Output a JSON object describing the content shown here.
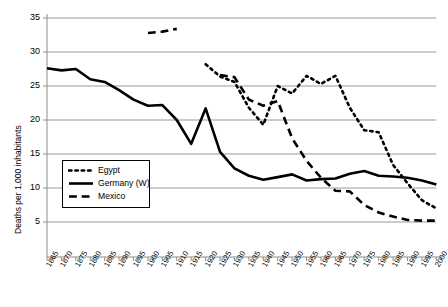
{
  "chart_data": {
    "type": "line",
    "title": "",
    "xlabel": "",
    "ylabel": "Deaths per 1,000 inhabitants",
    "ylim": [
      0,
      35
    ],
    "yticks": [
      5,
      10,
      15,
      20,
      25,
      30,
      35
    ],
    "ytick_labels": [
      "5",
      "10",
      "15",
      "20",
      "25",
      "30",
      "35"
    ],
    "grid": true,
    "legend_position": "center-left",
    "x": [
      1865,
      1870,
      1875,
      1880,
      1885,
      1890,
      1895,
      1900,
      1905,
      1910,
      1915,
      1920,
      1925,
      1930,
      1935,
      1940,
      1945,
      1950,
      1955,
      1960,
      1965,
      1970,
      1975,
      1980,
      1985,
      1990,
      1995,
      2000
    ],
    "xtick_labels": [
      "1865",
      "1870",
      "1875",
      "1880",
      "1885",
      "1890",
      "1895",
      "1900",
      "1905",
      "1910",
      "1915",
      "1920",
      "1925",
      "1930",
      "1935",
      "1940",
      "1945",
      "1950",
      "1955",
      "1960",
      "1965",
      "1970",
      "1975",
      "1980",
      "1985",
      "1990",
      "1995",
      "2000"
    ],
    "series": [
      {
        "name": "Egypt",
        "style": "dotted",
        "x": [
          1920,
          1925,
          1930,
          1935,
          1940,
          1945,
          1950,
          1955,
          1960,
          1965,
          1970,
          1975,
          1980,
          1985,
          1990,
          1995,
          2000
        ],
        "values": [
          28.2,
          26.4,
          25.6,
          21.8,
          19.3,
          25.0,
          23.9,
          26.5,
          25.3,
          26.5,
          21.8,
          18.5,
          18.2,
          13.4,
          10.7,
          8.2,
          7.0
        ]
      },
      {
        "name": "Germany (W)",
        "style": "solid",
        "x": [
          1865,
          1870,
          1875,
          1880,
          1885,
          1890,
          1895,
          1900,
          1905,
          1910,
          1915,
          1920,
          1925,
          1930,
          1935,
          1940,
          1945,
          1950,
          1955,
          1960,
          1965,
          1970,
          1975,
          1980,
          1985,
          1990,
          1995,
          2000
        ],
        "values": [
          27.6,
          27.3,
          27.5,
          26.0,
          25.6,
          24.4,
          23.0,
          22.1,
          22.2,
          20.0,
          16.5,
          21.7,
          15.3,
          12.9,
          11.8,
          11.2,
          11.6,
          12.0,
          11.1,
          11.3,
          11.4,
          12.1,
          12.5,
          11.8,
          11.7,
          11.5,
          11.1,
          10.5
        ]
      },
      {
        "name": "Mexico",
        "style": "dashed",
        "segments": [
          {
            "x": [
              1900,
              1905,
              1910
            ],
            "values": [
              32.8,
              33.0,
              33.4
            ]
          },
          {
            "x": [
              1925,
              1930,
              1935,
              1940,
              1945,
              1950,
              1955,
              1960,
              1965,
              1970,
              1975,
              1980,
              1985,
              1990,
              1995,
              2000
            ],
            "values": [
              26.6,
              26.3,
              23.0,
              22.1,
              22.8,
              17.3,
              14.0,
              11.5,
              9.6,
              9.5,
              7.5,
              6.4,
              5.8,
              5.3,
              5.2,
              5.2
            ]
          }
        ]
      }
    ]
  },
  "legend": {
    "items": [
      {
        "label": "Egypt",
        "style": "dotted"
      },
      {
        "label": "Germany (W)",
        "style": "solid"
      },
      {
        "label": "Mexico",
        "style": "dashed"
      }
    ]
  },
  "colors": {
    "series": "#000000",
    "grid": "#9a9a9a",
    "axis": "#8c8c8c",
    "background": "#ffffff"
  }
}
